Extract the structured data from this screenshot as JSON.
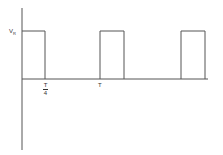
{
  "diagram": {
    "type": "square-wave",
    "y_axis_label": "V",
    "y_axis_label_sub": "R",
    "x_tick_labels": [
      {
        "num": "T",
        "den": "4"
      },
      {
        "label": "T"
      }
    ],
    "pulses": 3,
    "line_color": "#555555"
  }
}
